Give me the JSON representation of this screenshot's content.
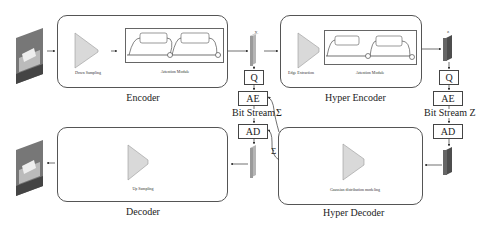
{
  "encoder": {
    "title": "Encoder",
    "downsample_label": "Down Sampling",
    "attention_label": "Attention Module"
  },
  "hyper_encoder": {
    "title": "Hyper Encoder",
    "edge_label": "Edge Extraction",
    "attention_label": "Attention Module"
  },
  "decoder": {
    "title": "Decoder",
    "upsample_label": "Up Sampling"
  },
  "hyper_decoder": {
    "title": "Hyper Decoder",
    "gaussian_label": "Gaussian distribution modeling"
  },
  "latent_y": {
    "label": "y"
  },
  "latent_z": {
    "label": "z"
  },
  "left_chain": {
    "q": "Q",
    "ae": "AE",
    "bitstream": "Bit Stream",
    "sigma_top": "Σ",
    "ad": "AD",
    "sigma_bottom": "Σ"
  },
  "right_chain": {
    "q": "Q",
    "ae": "AE",
    "bitstream": "Bit Stream Z",
    "ad": "AD"
  },
  "colors": {
    "trapezoid": "#d9d9d9",
    "latent_y": "#a8a8a8",
    "latent_z": "#555555",
    "border": "#555555"
  }
}
